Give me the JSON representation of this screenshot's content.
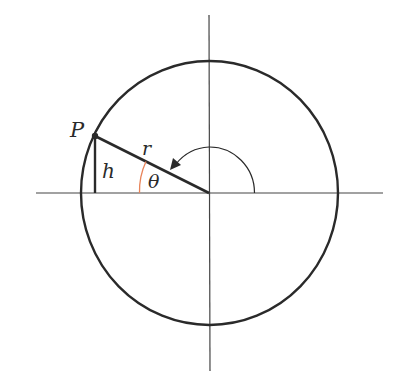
{
  "diagram": {
    "type": "unit-circle-angle",
    "labels": {
      "point": "P",
      "radius": "r",
      "height": "h",
      "angle": "θ"
    },
    "colors": {
      "stroke": "#2a2a2a",
      "axis": "#444444",
      "angle_arc": "#e8845a",
      "background": "#ffffff"
    },
    "geometry": {
      "center": [
        209,
        193
      ],
      "circle_rx": 128,
      "circle_ry": 132,
      "point_P": [
        95,
        136
      ],
      "rotation_arc_radius": 45
    }
  }
}
